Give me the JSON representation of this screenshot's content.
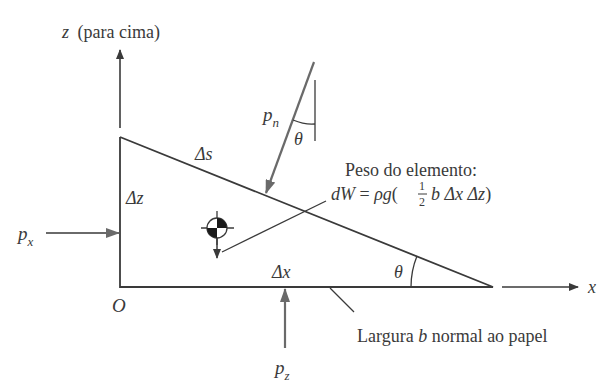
{
  "axes": {
    "z_label": "z",
    "z_note": "(para cima)",
    "x_label": "x",
    "origin_label": "O"
  },
  "element": {
    "ds_label": "Δs",
    "dz_label": "Δz",
    "dx_label": "Δx",
    "theta_label": "θ"
  },
  "pressures": {
    "px": "p",
    "px_sub": "x",
    "pz": "p",
    "pz_sub": "z",
    "pn": "p",
    "pn_sub": "n",
    "pn_theta": "θ"
  },
  "weight": {
    "title": "Peso do elemento:",
    "lhs": "dW",
    "eq": " = ",
    "rho_g": "ρg",
    "open": "(",
    "frac_num": "1",
    "frac_den": "2",
    "rest": "b Δx Δz",
    "close": ")"
  },
  "width_note": {
    "prefix": "Largura ",
    "b": "b",
    "suffix": " normal ao papel"
  },
  "colors": {
    "line": "#3a3a3a",
    "arrow_gray": "#6a6a6a",
    "background": "#ffffff"
  }
}
